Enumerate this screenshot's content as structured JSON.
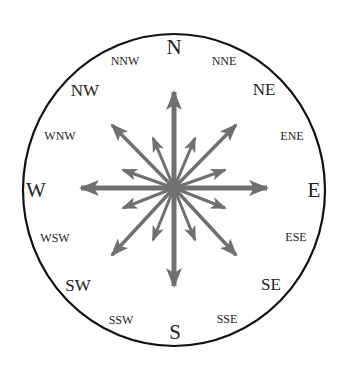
{
  "diagram": {
    "title": "",
    "type": "compass-rose",
    "colors": {
      "circle": "#111111",
      "arrows": "#707070",
      "labels": "#222222",
      "background": "#ffffff"
    },
    "labels": {
      "N": "N",
      "NNE": "NNE",
      "NE": "NE",
      "ENE": "ENE",
      "E": "E",
      "ESE": "ESE",
      "SE": "SE",
      "SSE": "SSE",
      "S": "S",
      "SSW": "SSW",
      "SW": "SW",
      "WSW": "WSW",
      "W": "W",
      "WNW": "WNW",
      "NW": "NW",
      "NNW": "NNW"
    },
    "directions": [
      {
        "name": "N",
        "angle_deg": 0,
        "rank": "cardinal"
      },
      {
        "name": "NNE",
        "angle_deg": 22.5,
        "rank": "tertiary"
      },
      {
        "name": "NE",
        "angle_deg": 45,
        "rank": "intercardinal"
      },
      {
        "name": "ENE",
        "angle_deg": 67.5,
        "rank": "tertiary"
      },
      {
        "name": "E",
        "angle_deg": 90,
        "rank": "cardinal"
      },
      {
        "name": "ESE",
        "angle_deg": 112.5,
        "rank": "tertiary"
      },
      {
        "name": "SE",
        "angle_deg": 135,
        "rank": "intercardinal"
      },
      {
        "name": "SSE",
        "angle_deg": 157.5,
        "rank": "tertiary"
      },
      {
        "name": "S",
        "angle_deg": 180,
        "rank": "cardinal"
      },
      {
        "name": "SSW",
        "angle_deg": 202.5,
        "rank": "tertiary"
      },
      {
        "name": "SW",
        "angle_deg": 225,
        "rank": "intercardinal"
      },
      {
        "name": "WSW",
        "angle_deg": 247.5,
        "rank": "tertiary"
      },
      {
        "name": "W",
        "angle_deg": 270,
        "rank": "cardinal"
      },
      {
        "name": "WNW",
        "angle_deg": 292.5,
        "rank": "tertiary"
      },
      {
        "name": "NW",
        "angle_deg": 315,
        "rank": "intercardinal"
      },
      {
        "name": "NNW",
        "angle_deg": 337.5,
        "rank": "tertiary"
      }
    ]
  }
}
